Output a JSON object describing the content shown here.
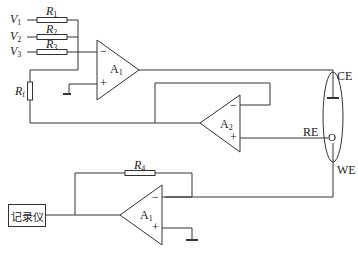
{
  "diagram": {
    "type": "circuit",
    "inputs": [
      {
        "label": "V",
        "sub": "1"
      },
      {
        "label": "V",
        "sub": "2"
      },
      {
        "label": "V",
        "sub": "3"
      }
    ],
    "resistors": [
      {
        "label": "R",
        "sub": "1"
      },
      {
        "label": "R",
        "sub": "2"
      },
      {
        "label": "R",
        "sub": "3"
      },
      {
        "label": "R",
        "sub": "f"
      },
      {
        "label": "R",
        "sub": "4"
      }
    ],
    "amplifiers": [
      {
        "label": "A",
        "sub": "1",
        "minus": "−",
        "plus": "+"
      },
      {
        "label": "A",
        "sub": "2",
        "minus": "−",
        "plus": "+"
      },
      {
        "label": "A",
        "sub": "1",
        "minus": "−",
        "plus": "+"
      }
    ],
    "electrodes": {
      "ce": "CE",
      "re": "RE",
      "we": "WE",
      "re_marker": "O"
    },
    "recorder": "记录仪",
    "colors": {
      "line": "#333333",
      "background": "#ffffff"
    }
  }
}
